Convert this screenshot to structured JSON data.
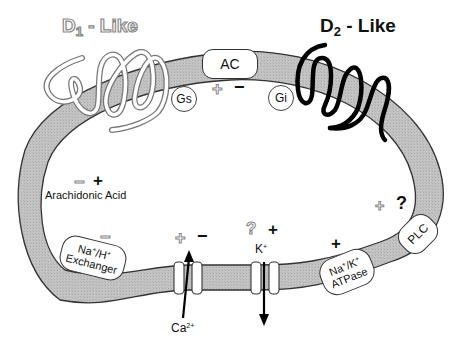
{
  "diagram": {
    "receptors": {
      "d1": {
        "label": "D1 - Like",
        "base": "D",
        "subscript": "1",
        "suffix": " - Like",
        "style": "outlined"
      },
      "d2": {
        "label": "D2 - Like",
        "base": "D",
        "subscript": "2",
        "suffix": " - Like",
        "style": "solid"
      }
    },
    "g_proteins": {
      "gs": "Gs",
      "gi": "Gi"
    },
    "effectors": {
      "ac": {
        "label": "AC",
        "signs": [
          "+",
          "−"
        ]
      },
      "arachidonic_acid": {
        "label": "Arachidonic Acid",
        "signs": [
          "−",
          "+"
        ]
      },
      "na_h_exchanger": {
        "line1": "Na+/H+",
        "line2": "Exchanger",
        "sign": "−"
      },
      "ca_channel": {
        "ion": "Ca",
        "charge": "2+",
        "signs": [
          "+",
          "−"
        ],
        "flow": "inward"
      },
      "k_channel": {
        "ion": "K",
        "charge": "+",
        "signs": [
          "?",
          "+"
        ],
        "flow": "outward"
      },
      "na_k_atpase": {
        "line1": "Na+/K+",
        "line2": "ATPase",
        "sign": "+"
      },
      "plc": {
        "label": "PLC",
        "signs": [
          "+",
          "?"
        ]
      }
    },
    "legend_note": "Outlined symbols = D1-like effects; solid symbols = D2-like effects",
    "colors": {
      "membrane_fill": "#bdbdbd",
      "membrane_stroke": "#333333",
      "d1_outline": "#888888",
      "d2_fill": "#000000"
    }
  }
}
